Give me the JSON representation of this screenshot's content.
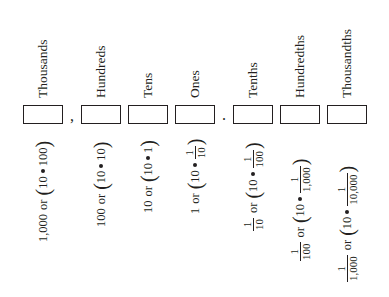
{
  "places": [
    {
      "label": "Thousands",
      "value": "1,000",
      "factor": "100",
      "factor_type": "whole"
    },
    {
      "label": "Hundreds",
      "value": "100",
      "factor": "10",
      "factor_type": "whole"
    },
    {
      "label": "Tens",
      "value": "10",
      "factor": "1",
      "factor_type": "whole"
    },
    {
      "label": "Ones",
      "value": "1",
      "factor_den": "10",
      "factor_type": "fraction"
    },
    {
      "label": "Tenths",
      "value_den": "10",
      "factor_den": "100",
      "factor_type": "fraction"
    },
    {
      "label": "Hundredths",
      "value_den": "100",
      "factor_den": "1,000",
      "factor_type": "fraction"
    },
    {
      "label": "Thousandths",
      "value_den": "1,000",
      "factor_den": "10,000",
      "factor_type": "fraction"
    }
  ],
  "separators": {
    "comma": ",",
    "decimal_point": "."
  },
  "common": {
    "or": "or",
    "ten": "10",
    "one": "1",
    "open_paren": "(",
    "close_paren": ")"
  }
}
